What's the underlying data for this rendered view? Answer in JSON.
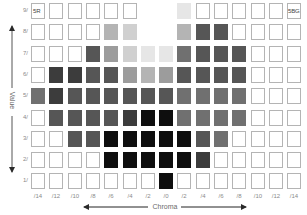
{
  "chart_data": {
    "type": "heatmap",
    "title": "",
    "xlabel": "Chroma",
    "ylabel": "Value",
    "x_ticks": [
      "/14",
      "/12",
      "/10",
      "/8",
      "/6",
      "/4",
      "/2",
      "/0",
      "/2",
      "/4",
      "/6",
      "/8",
      "/10",
      "/12",
      "/14"
    ],
    "y_ticks": [
      "9/",
      "8/",
      "7/",
      "6/",
      "5/",
      "4/",
      "3/",
      "2/",
      "1/"
    ],
    "corner_labels": {
      "top_left": "5R",
      "top_right": "5BG"
    },
    "legend": {
      "empty": "#ffffff",
      "vl": "#e6e6e6",
      "l": "#d0d0d0",
      "ml": "#b4b4b4",
      "m": "#9c9c9c",
      "md": "#707070",
      "d": "#565656",
      "vd": "#3c3c3c",
      "k": "#0e0e0e",
      "none": "absent"
    },
    "grid": [
      [
        "empty",
        "empty",
        "empty",
        "empty",
        "empty",
        "empty",
        "none",
        "none",
        "vl",
        "empty",
        "empty",
        "empty",
        "empty",
        "empty",
        "empty"
      ],
      [
        "empty",
        "empty",
        "empty",
        "empty",
        "ml",
        "l",
        "none",
        "none",
        "ml",
        "d",
        "d",
        "empty",
        "empty",
        "empty",
        "empty"
      ],
      [
        "empty",
        "empty",
        "empty",
        "d",
        "m",
        "l",
        "vl",
        "vl",
        "md",
        "d",
        "d",
        "d",
        "empty",
        "empty",
        "empty"
      ],
      [
        "empty",
        "vd",
        "vd",
        "d",
        "d",
        "m",
        "ml",
        "m",
        "d",
        "d",
        "d",
        "d",
        "empty",
        "empty",
        "empty"
      ],
      [
        "md",
        "vd",
        "d",
        "d",
        "d",
        "d",
        "d",
        "d",
        "md",
        "md",
        "md",
        "md",
        "empty",
        "empty",
        "empty"
      ],
      [
        "empty",
        "d",
        "d",
        "d",
        "d",
        "vd",
        "k",
        "k",
        "md",
        "md",
        "md",
        "md",
        "empty",
        "empty",
        "empty"
      ],
      [
        "empty",
        "empty",
        "d",
        "d",
        "k",
        "k",
        "k",
        "k",
        "k",
        "d",
        "md",
        "empty",
        "empty",
        "empty",
        "empty"
      ],
      [
        "empty",
        "empty",
        "empty",
        "empty",
        "k",
        "k",
        "k",
        "k",
        "k",
        "vd",
        "empty",
        "empty",
        "empty",
        "empty",
        "empty"
      ],
      [
        "empty",
        "empty",
        "empty",
        "empty",
        "empty",
        "empty",
        "empty",
        "k",
        "empty",
        "empty",
        "empty",
        "empty",
        "empty",
        "empty",
        "empty"
      ]
    ],
    "axis_arrows": {
      "x": "bidirectional",
      "y": "bidirectional"
    },
    "grid_lines": false
  }
}
